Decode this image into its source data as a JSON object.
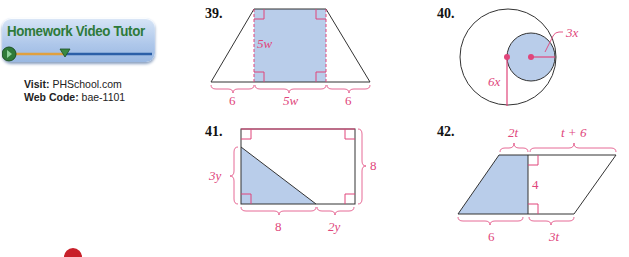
{
  "promo": {
    "title": "Homework Video Tutor",
    "visit_label": "Visit:",
    "visit_value": "PHSchool.com",
    "webcode_label": "Web Code:",
    "webcode_value": "bae-1101"
  },
  "exercises": [
    {
      "number": "39.",
      "shape": "trapezoid with shaded inner rectangle",
      "labels": {
        "height": "5w",
        "left_base": "6",
        "middle_base": "5w",
        "right_base": "6"
      }
    },
    {
      "number": "40.",
      "shape": "circle with shaded inner circle",
      "labels": {
        "small_radius": "3x",
        "large_radius": "6x"
      }
    },
    {
      "number": "41.",
      "shape": "rectangle with shaded right triangle",
      "labels": {
        "triangle_height": "3y",
        "rect_height": "8",
        "triangle_base": "8",
        "remaining_base": "2y"
      }
    },
    {
      "number": "42.",
      "shape": "parallelogram with shaded trapezoid",
      "labels": {
        "top_left": "2t",
        "top_right": "t + 6",
        "height": "4",
        "bottom_left": "6",
        "bottom_right": "3t"
      }
    }
  ],
  "colors": {
    "label": "#e0457b",
    "fill": "#b9cdea",
    "line": "#333333",
    "title_green": "#2e7a3a"
  }
}
